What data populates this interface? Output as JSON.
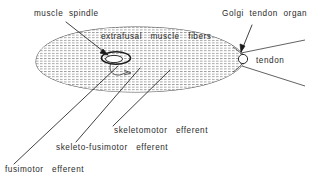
{
  "figure": {
    "kind": "anatomical-line-diagram",
    "background_color": "#ffffff",
    "ink_color": "#2b2b2b",
    "hatch_color": "#9a9a9a"
  },
  "labels": {
    "muscle_spindle": "muscle  spindle",
    "extrafusal": "extrafusal   muscle   fibers",
    "golgi": "Golgi  tendon  organ",
    "tendon": "tendon",
    "skeletomotor": "skeletomotor   efferent",
    "skeleto_fusimotor": "skeleto-fusimotor   efferent",
    "fusimotor": "fusimotor   efferent"
  },
  "parts": {
    "muscle_belly": "extrafusal muscle fiber mass",
    "spindle": "muscle spindle",
    "golgi_tendon_organ": "Golgi tendon organ",
    "tendon": "tendon"
  }
}
